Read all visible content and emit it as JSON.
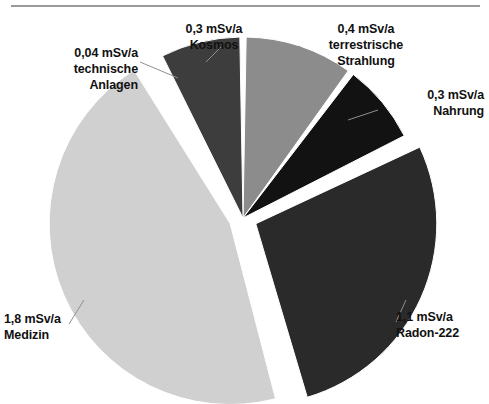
{
  "chart_data": {
    "type": "pie",
    "title": "",
    "subtitle": "",
    "xlabel": "",
    "ylabel": "",
    "unit": "mSv/a",
    "legend_position": "none",
    "grid": false,
    "total": 3.94,
    "start_angle_deg": 0,
    "direction": "clockwise",
    "categories": [
      "terrestrische Strahlung",
      "Nahrung",
      "Radon-222",
      "Medizin",
      "technische Anlagen",
      "Kosmos"
    ],
    "values": [
      0.4,
      0.3,
      1.1,
      1.8,
      0.04,
      0.3
    ],
    "value_labels": [
      "0,4 mSv/a",
      "0,3 mSv/a",
      "1,1 mSv/a",
      "1,8 mSv/a",
      "0,04 mSv/a",
      "0,3 mSv/a"
    ],
    "colors": [
      "#8c8c8c",
      "#121212",
      "#2a2a2a",
      "#d0d0d0",
      "#ffffff",
      "#3d3d3d"
    ],
    "exploded": [
      false,
      false,
      true,
      true,
      false,
      false
    ],
    "slices": [
      {
        "name": "terrestrische Strahlung",
        "value": 0.4,
        "value_text": "0,4 mSv/a",
        "label_line1": "0,4 mSv/a",
        "label_line2": "terrestrische",
        "label_line3": "Strahlung",
        "color": "#8c8c8c",
        "start_deg": 0.0,
        "end_deg": 36.55,
        "percent": 10.2,
        "exploded": false
      },
      {
        "name": "Nahrung",
        "value": 0.3,
        "value_text": "0,3 mSv/a",
        "label_line1": "0,3 mSv/a",
        "label_line2": "Nahrung",
        "label_line3": "",
        "color": "#121212",
        "start_deg": 36.55,
        "end_deg": 63.96,
        "percent": 7.6,
        "exploded": false
      },
      {
        "name": "Radon-222",
        "value": 1.1,
        "value_text": "1,1 mSv/a",
        "label_line1": "1,1 mSv/a",
        "label_line2": "Radon-222",
        "label_line3": "",
        "color": "#2a2a2a",
        "start_deg": 63.96,
        "end_deg": 164.47,
        "percent": 27.9,
        "exploded": true
      },
      {
        "name": "Medizin",
        "value": 1.8,
        "value_text": "1,8 mSv/a",
        "label_line1": "1,8 mSv/a",
        "label_line2": "Medizin",
        "label_line3": "",
        "color": "#d0d0d0",
        "start_deg": 164.47,
        "end_deg": 328.93,
        "percent": 45.7,
        "exploded": true
      },
      {
        "name": "technische Anlagen",
        "value": 0.04,
        "value_text": "0,04 mSv/a",
        "label_line1": "0,04 mSv/a",
        "label_line2": "technische",
        "label_line3": "Anlagen",
        "color": "#ffffff",
        "start_deg": 328.93,
        "end_deg": 332.59,
        "percent": 1.0,
        "exploded": false
      },
      {
        "name": "Kosmos",
        "value": 0.3,
        "value_text": "0,3 mSv/a",
        "label_line1": "0,3 mSv/a",
        "label_line2": "Kosmos",
        "label_line3": "",
        "color": "#3d3d3d",
        "start_deg": 332.59,
        "end_deg": 360.0,
        "percent": 7.6,
        "exploded": false
      }
    ]
  },
  "labels": {
    "technische": {
      "line1": "0,04 mSv/a",
      "line2": "technische",
      "line3": "Anlagen"
    },
    "kosmos": {
      "line1": "0,3 mSv/a",
      "line2": "Kosmos"
    },
    "terrestrisch": {
      "line1": "0,4 mSv/a",
      "line2": "terrestrische",
      "line3": "Strahlung"
    },
    "nahrung": {
      "line1": "0,3 mSv/a",
      "line2": "Nahrung"
    },
    "radon": {
      "line1": "1,1 mSv/a",
      "line2": "Radon-222"
    },
    "medizin": {
      "line1": "1,8 mSv/a",
      "line2": "Medizin"
    }
  },
  "style": {
    "background": "#ffffff",
    "rule_color": "#9a9a9a",
    "text_color": "#111111",
    "leader_color": "#8f8f8f"
  }
}
